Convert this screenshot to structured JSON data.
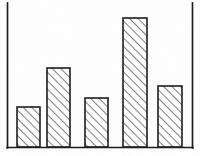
{
  "figure": {
    "kind": "bar-chart-illustration",
    "background_color": "#ffffff",
    "ink_color": "#1b1b1b",
    "bar_fill_color": "#ffffff",
    "hatch_color": "#5a5a5a",
    "hatch_style": "diagonal-forward-slash",
    "frame": {
      "left_axis": true,
      "bottom_axis": true,
      "right_border": true,
      "top_border": false
    }
  },
  "chart_data": {
    "type": "bar",
    "title": "",
    "subtitle": "",
    "xlabel": "",
    "ylabel": "",
    "categories": [
      "1",
      "2",
      "3",
      "4",
      "5"
    ],
    "values": [
      40,
      79,
      49,
      129,
      61
    ],
    "ylim": [
      0,
      147
    ],
    "xlim": [
      0,
      185
    ],
    "grid": false,
    "legend": null,
    "tick_labels_x": [],
    "tick_labels_y": [],
    "annotations": [],
    "series": [
      {
        "name": "series-1",
        "values": [
          40,
          79,
          49,
          129,
          61
        ]
      }
    ],
    "bars": [
      {
        "category": "1",
        "value": 40,
        "x": 17,
        "width": 23,
        "top_y": 107,
        "base_y": 147
      },
      {
        "category": "2",
        "value": 79,
        "x": 47,
        "width": 23,
        "top_y": 68,
        "base_y": 147
      },
      {
        "category": "3",
        "value": 49,
        "x": 85,
        "width": 23,
        "top_y": 98,
        "base_y": 147
      },
      {
        "category": "4",
        "value": 129,
        "x": 123,
        "width": 24,
        "top_y": 18,
        "base_y": 147
      },
      {
        "category": "5",
        "value": 61,
        "x": 158,
        "width": 24,
        "top_y": 86,
        "base_y": 147
      }
    ],
    "axes_geometry": {
      "left_axis_x": 7.5,
      "right_border_x": 192.5,
      "baseline_y": 147.5,
      "axis_top_y": 3
    }
  }
}
